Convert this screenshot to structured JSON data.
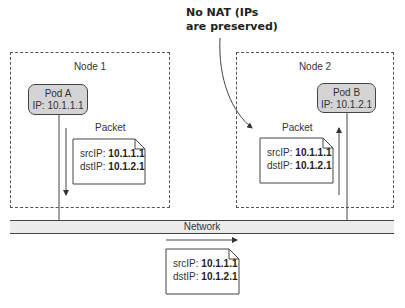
{
  "callout": {
    "line1": "No NAT (IPs",
    "line2": "are preserved)"
  },
  "nodes": [
    {
      "label": "Node 1",
      "pod": {
        "name": "Pod A",
        "ip": "IP: 10.1.1.1"
      },
      "packet": {
        "title": "Packet",
        "src_label": "srcIP: ",
        "src": "10.1.1.1",
        "dst_label": "dstIP: ",
        "dst": "10.1.2.1"
      }
    },
    {
      "label": "Node 2",
      "pod": {
        "name": "Pod B",
        "ip": "IP: 10.1.2.1"
      },
      "packet": {
        "title": "Packet",
        "src_label": "srcIP: ",
        "src": "10.1.1.1",
        "dst_label": "dstIP: ",
        "dst": "10.1.2.1"
      }
    }
  ],
  "network": {
    "label": "Network",
    "packet": {
      "src_label": "srcIP: ",
      "src": "10.1.1.1",
      "dst_label": "dstIP: ",
      "dst": "10.1.2.1"
    }
  }
}
